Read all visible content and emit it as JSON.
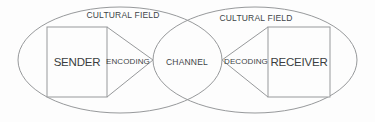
{
  "diagram": {
    "labels": {
      "cultural_field_left": "CULTURAL FIELD",
      "cultural_field_right": "CULTURAL FIELD",
      "sender": "SENDER",
      "encoding": "ENCODING",
      "channel": "CHANNEL",
      "decoding": "DECODING",
      "receiver": "RECEIVER"
    },
    "colors": {
      "line": "#97999b",
      "text": "#404447",
      "background": "#fdfdfd"
    }
  }
}
